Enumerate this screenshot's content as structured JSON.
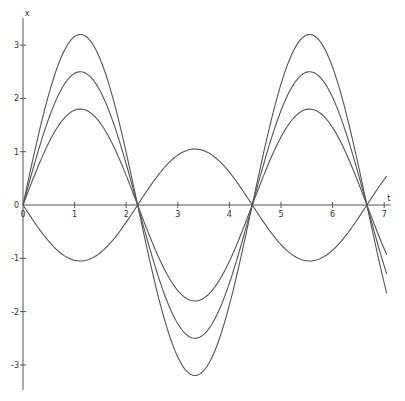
{
  "chart_data": {
    "type": "line",
    "title": "",
    "xlabel": "t",
    "ylabel": "x",
    "xlim": [
      0,
      7.05
    ],
    "ylim": [
      -3.5,
      3.5
    ],
    "grid": false,
    "legend": null,
    "x_ticks": [
      "0",
      "1",
      "2",
      "3",
      "4",
      "5",
      "6",
      "7"
    ],
    "y_ticks": [
      "-3",
      "-2",
      "-1",
      "0",
      "1",
      "2",
      "3"
    ],
    "function_form": "x(t) = A * sin(sqrt(2) * t)",
    "series": [
      {
        "name": "A=3.2",
        "amplitude": 3.2,
        "omega": 1.4142,
        "x": [
          0,
          1.11,
          2.22,
          3.33,
          4.44,
          5.55,
          6.66,
          7.05
        ],
        "values": [
          0,
          3.2,
          0,
          -3.15,
          0,
          3.22,
          0,
          -1.6
        ]
      },
      {
        "name": "A=2.5",
        "amplitude": 2.5,
        "omega": 1.4142,
        "x": [
          0,
          1.11,
          2.22,
          3.33,
          4.44,
          5.55,
          6.66,
          7.05
        ],
        "values": [
          0,
          2.5,
          0,
          -2.45,
          0,
          2.52,
          0,
          -1.25
        ]
      },
      {
        "name": "A=1.8",
        "amplitude": 1.8,
        "omega": 1.4142,
        "x": [
          0,
          1.11,
          2.22,
          3.33,
          4.44,
          5.55,
          6.66,
          7.05
        ],
        "values": [
          0,
          1.78,
          0,
          -1.72,
          0,
          1.8,
          0,
          -0.9
        ]
      },
      {
        "name": "A=-1.05",
        "amplitude": -1.05,
        "omega": 1.4142,
        "x": [
          0,
          1.11,
          2.22,
          3.33,
          4.44,
          5.55,
          6.66,
          7.05
        ],
        "values": [
          0,
          -1.03,
          0,
          1.08,
          0,
          -1.0,
          0,
          0.52
        ]
      }
    ]
  },
  "labels": {
    "x_axis": "t",
    "y_axis": "x",
    "origin": "0"
  }
}
